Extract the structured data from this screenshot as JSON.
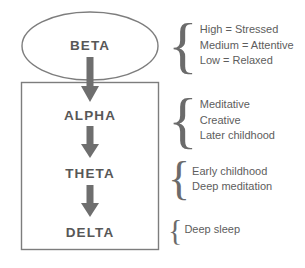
{
  "diagram": {
    "title_semantics": "brainwave-states-hierarchy",
    "colors": {
      "stroke": "#7d7d7d",
      "arrow": "#6e6e6e",
      "label_text": "#575757",
      "annotation_text": "#5d5d5d",
      "brace": "#6b6b6b",
      "background": "#ffffff"
    },
    "nodes": [
      {
        "id": "beta",
        "label": "BETA",
        "shape": "ellipse"
      },
      {
        "id": "alpha",
        "label": "ALPHA",
        "shape": "none"
      },
      {
        "id": "theta",
        "label": "THETA",
        "shape": "none"
      },
      {
        "id": "delta",
        "label": "DELTA",
        "shape": "none"
      }
    ],
    "arrows": [
      {
        "from": "beta",
        "to": "alpha"
      },
      {
        "from": "alpha",
        "to": "theta"
      },
      {
        "from": "theta",
        "to": "delta"
      }
    ],
    "container_box": {
      "encloses": [
        "alpha",
        "theta",
        "delta"
      ]
    },
    "annotations": [
      {
        "id": "beta-annotation",
        "for": "beta",
        "lines": [
          "High = Stressed",
          "Medium = Attentive",
          "Low = Relaxed"
        ]
      },
      {
        "id": "alpha-annotation",
        "for": "alpha",
        "lines": [
          "Meditative",
          "Creative",
          "Later childhood"
        ]
      },
      {
        "id": "theta-annotation",
        "for": "theta",
        "lines": [
          "Early childhood",
          "Deep meditation"
        ]
      },
      {
        "id": "delta-annotation",
        "for": "delta",
        "lines": [
          "Deep sleep"
        ]
      }
    ],
    "brace_glyph": "{"
  }
}
